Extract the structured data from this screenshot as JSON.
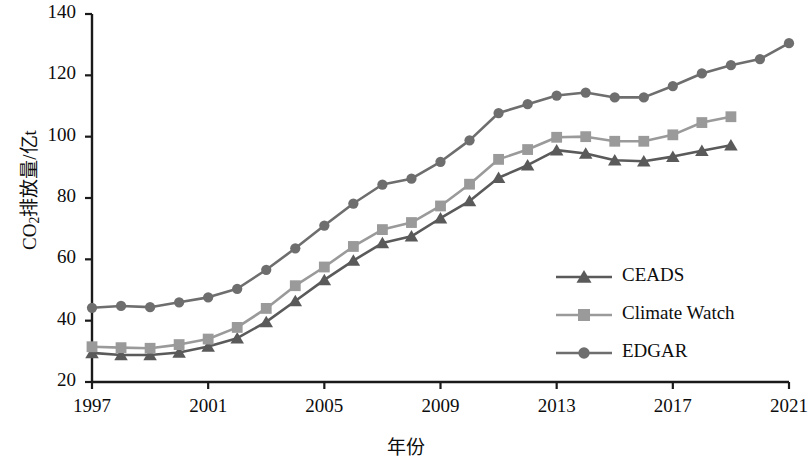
{
  "chart_data": {
    "type": "line",
    "title": "",
    "xlabel": "年份",
    "ylabel": "CO2排放量/亿t",
    "ylabel_parts": {
      "prefix": "CO",
      "sub": "2",
      "suffix": "排放量/亿t"
    },
    "xlim": [
      1997,
      2021
    ],
    "ylim": [
      20,
      140
    ],
    "y_ticks": [
      20,
      40,
      60,
      80,
      100,
      120,
      140
    ],
    "x_ticks": [
      1997,
      2001,
      2005,
      2009,
      2013,
      2017,
      2021
    ],
    "x_tick_labels": [
      "1997",
      "2001",
      "2005",
      "2009",
      "2013",
      "2017",
      "2021"
    ],
    "y_tick_labels": [
      "20",
      "40",
      "60",
      "80",
      "100",
      "120",
      "140"
    ],
    "grid": false,
    "legend_position": "center-right",
    "x": [
      1997,
      1998,
      1999,
      2000,
      2001,
      2002,
      2003,
      2004,
      2005,
      2006,
      2007,
      2008,
      2009,
      2010,
      2011,
      2012,
      2013,
      2014,
      2015,
      2016,
      2017,
      2018,
      2019,
      2020,
      2021
    ],
    "series": [
      {
        "name": "CEADS",
        "marker": "triangle",
        "color": "#5a5a5a",
        "x": [
          1997,
          1998,
          1999,
          2000,
          2001,
          2002,
          2003,
          2004,
          2005,
          2006,
          2007,
          2008,
          2009,
          2010,
          2011,
          2012,
          2013,
          2014,
          2015,
          2016,
          2017,
          2018,
          2019
        ],
        "values": [
          29.5,
          28.8,
          28.8,
          29.6,
          31.6,
          34.3,
          39.6,
          46.4,
          53.3,
          59.6,
          65.3,
          67.5,
          73.4,
          79.0,
          86.6,
          90.7,
          95.6,
          94.5,
          92.3,
          92.0,
          93.5,
          95.4,
          97.2
        ]
      },
      {
        "name": "Climate Watch",
        "marker": "square",
        "color": "#9a9a9a",
        "x": [
          1997,
          1998,
          1999,
          2000,
          2001,
          2002,
          2003,
          2004,
          2005,
          2006,
          2007,
          2008,
          2009,
          2010,
          2011,
          2012,
          2013,
          2014,
          2015,
          2016,
          2017,
          2018,
          2019
        ],
        "values": [
          31.5,
          31.2,
          31.0,
          32.2,
          34.0,
          37.8,
          44.0,
          51.4,
          57.5,
          64.2,
          69.7,
          72.0,
          77.4,
          84.5,
          92.6,
          95.8,
          99.8,
          100.0,
          98.5,
          98.5,
          100.6,
          104.6,
          106.5
        ]
      },
      {
        "name": "EDGAR",
        "marker": "circle",
        "color": "#6e6e6e",
        "x": [
          1997,
          1998,
          1999,
          2000,
          2001,
          2002,
          2003,
          2004,
          2005,
          2006,
          2007,
          2008,
          2009,
          2010,
          2011,
          2012,
          2013,
          2014,
          2015,
          2016,
          2017,
          2018,
          2019,
          2020,
          2021
        ],
        "values": [
          44.2,
          44.8,
          44.4,
          46.0,
          47.6,
          50.4,
          56.6,
          63.6,
          71.0,
          78.2,
          84.4,
          86.3,
          91.8,
          98.8,
          107.7,
          110.6,
          113.4,
          114.4,
          112.8,
          112.8,
          116.5,
          120.6,
          123.3,
          125.3,
          130.5
        ]
      }
    ]
  },
  "legend": {
    "items": [
      {
        "label": "CEADS"
      },
      {
        "label": "Climate Watch"
      },
      {
        "label": "EDGAR"
      }
    ]
  },
  "colors": {
    "ceads": "#5a5a5a",
    "climate_watch": "#9a9a9a",
    "edgar": "#6e6e6e",
    "axis": "#1a1a1a",
    "background": "#ffffff"
  }
}
